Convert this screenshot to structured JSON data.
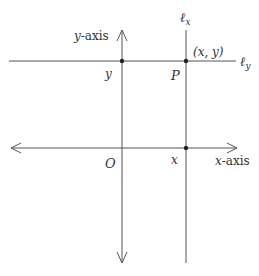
{
  "diagram": {
    "axes": {
      "x_axis_label_var": "x",
      "x_axis_label_suffix": "-axis",
      "y_axis_label_var": "y",
      "y_axis_label_suffix": "-axis",
      "origin_label": "O"
    },
    "lines": {
      "lx_label_main": "ℓ",
      "lx_label_sub": "x",
      "ly_label_main": "ℓ",
      "ly_label_sub": "y"
    },
    "points": {
      "y_intercept_label": "y",
      "x_intercept_label": "x",
      "p_label": "P",
      "p_coords_label": "(x, y)"
    },
    "colors": {
      "line": "#555555",
      "point": "#222222",
      "text": "#333333"
    }
  }
}
